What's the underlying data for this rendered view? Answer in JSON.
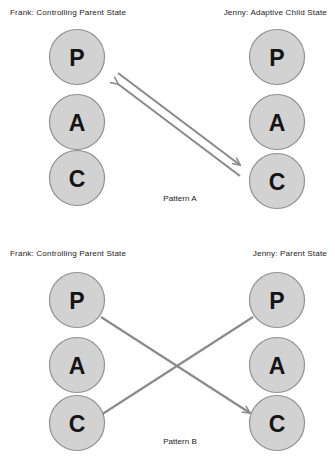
{
  "figure": {
    "background_color": "#ffffff",
    "circle_fill": "#d2d2d2",
    "circle_stroke": "#8f8f8f",
    "arrow_color": "#8a8a8a",
    "text_color": "#1b1b1b"
  },
  "patterns": [
    {
      "id": "pattern-a",
      "caption": "Pattern A",
      "left_party": {
        "label": "Frank: Controlling Parent State",
        "name": "Frank",
        "state": "Controlling Parent State",
        "ego_states": [
          {
            "code": "P",
            "name": "Parent"
          },
          {
            "code": "A",
            "name": "Adult"
          },
          {
            "code": "C",
            "name": "Child"
          }
        ]
      },
      "right_party": {
        "label": "Jenny: Adaptive Child State",
        "name": "Jenny",
        "state": "Adaptive Child State",
        "ego_states": [
          {
            "code": "P",
            "name": "Parent"
          },
          {
            "code": "A",
            "name": "Adult"
          },
          {
            "code": "C",
            "name": "Child"
          }
        ]
      },
      "transactions": [
        {
          "from": "left.P",
          "to": "right.C",
          "direction": "to-right",
          "style": "parallel-upper"
        },
        {
          "from": "right.C",
          "to": "left.P",
          "direction": "to-left",
          "style": "parallel-lower"
        }
      ]
    },
    {
      "id": "pattern-b",
      "caption": "Pattern B",
      "left_party": {
        "label": "Frank: Controlling Parent State",
        "name": "Frank",
        "state": "Controlling Parent State",
        "ego_states": [
          {
            "code": "P",
            "name": "Parent"
          },
          {
            "code": "A",
            "name": "Adult"
          },
          {
            "code": "C",
            "name": "Child"
          }
        ]
      },
      "right_party": {
        "label": "Jenny: Parent State",
        "name": "Jenny",
        "state": "Parent State",
        "ego_states": [
          {
            "code": "P",
            "name": "Parent"
          },
          {
            "code": "A",
            "name": "Adult"
          },
          {
            "code": "C",
            "name": "Child"
          }
        ]
      },
      "transactions": [
        {
          "from": "left.P",
          "to": "right.C",
          "direction": "to-right",
          "style": "crossed"
        },
        {
          "from": "right.P",
          "to": "left.C",
          "direction": "to-left",
          "style": "crossed"
        }
      ]
    }
  ]
}
